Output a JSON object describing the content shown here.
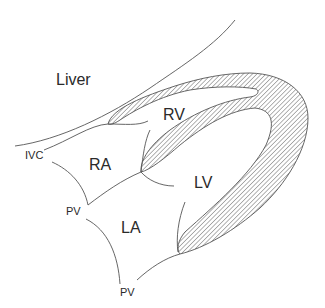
{
  "diagram": {
    "type": "anatomical-schematic",
    "colors": {
      "line": "#555555",
      "hatch": "#555555",
      "text": "#2a2a2a",
      "background": "#ffffff"
    },
    "labels": {
      "liver": "Liver",
      "rv": "RV",
      "ra": "RA",
      "lv": "LV",
      "la": "LA",
      "ivc": "IVC",
      "pv_upper": "PV",
      "pv_lower": "PV"
    }
  }
}
